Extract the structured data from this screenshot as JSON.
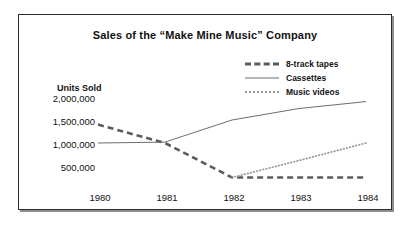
{
  "chart_data": {
    "type": "line",
    "title": "Sales of the “Make Mine Music” Company",
    "xlabel": "",
    "ylabel": "Units Sold",
    "x": [
      1980,
      1981,
      1982,
      1983,
      1984
    ],
    "xtick_labels": [
      "1980",
      "1981",
      "1982",
      "1983",
      "1984"
    ],
    "ytick_labels": [
      "2,000,000",
      "1,500,000",
      "1,000,000",
      "500,000"
    ],
    "ytick_values": [
      2000000,
      1500000,
      1000000,
      500000
    ],
    "ylim": [
      0,
      2250000
    ],
    "xlim": [
      1979.5,
      1984.5
    ],
    "grid": false,
    "legend_position": "top-right",
    "series": [
      {
        "name": "8-track tapes",
        "style": "dashed",
        "color": "#5b5b5b",
        "values": [
          1400000,
          1000000,
          250000,
          250000,
          250000
        ]
      },
      {
        "name": "Cassettes",
        "style": "solid",
        "color": "#6d6d6d",
        "values": [
          1000000,
          1020000,
          1500000,
          1750000,
          1900000
        ]
      },
      {
        "name": "Music videos",
        "style": "dotted",
        "color": "#9a9a9a",
        "values": [
          null,
          null,
          250000,
          620000,
          1000000
        ]
      }
    ]
  },
  "legend": {
    "items": [
      {
        "label": "8-track tapes",
        "style": "dashed"
      },
      {
        "label": "Cassettes",
        "style": "solid"
      },
      {
        "label": "Music videos",
        "style": "dotted"
      }
    ]
  },
  "axis": {
    "units_label": "Units Sold",
    "y_ticks": [
      "2,000,000",
      "1,500,000",
      "1,000,000",
      "500,000"
    ],
    "x_ticks": [
      "1980",
      "1981",
      "1982",
      "1983",
      "1984"
    ]
  }
}
